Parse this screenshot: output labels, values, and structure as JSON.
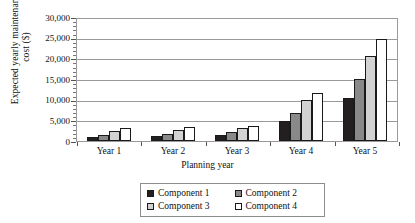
{
  "chart_data": {
    "type": "bar",
    "title": "",
    "xlabel": "Planning year",
    "ylabel": "Expected yearly maintenance cost ($)",
    "categories": [
      "Year 1",
      "Year 2",
      "Year 3",
      "Year 4",
      "Year 5"
    ],
    "series": [
      {
        "name": "Component 1",
        "color": "#231f20",
        "values": [
          1100,
          1300,
          1600,
          4800,
          10500
        ]
      },
      {
        "name": "Component 2",
        "color": "#898989",
        "values": [
          1500,
          1700,
          2100,
          6800,
          15300
        ]
      },
      {
        "name": "Component 3",
        "color": "#d2d2d2",
        "values": [
          2400,
          2700,
          3100,
          10000,
          20900
        ]
      },
      {
        "name": "Component 4",
        "color": "#ffffff",
        "values": [
          3200,
          3400,
          3700,
          11900,
          25000
        ]
      }
    ],
    "ylim": [
      0,
      30000
    ],
    "ytick_values": [
      0,
      5000,
      10000,
      15000,
      20000,
      25000,
      30000
    ],
    "ytick_labels": [
      "0",
      "5,000",
      "10,000",
      "15,000",
      "20,000",
      "25,000",
      "30,000"
    ],
    "grid": "horizontal-major",
    "legend_position": "bottom-center",
    "legend_entries": [
      "Component 1",
      "Component 2",
      "Component 3",
      "Component 4"
    ]
  }
}
